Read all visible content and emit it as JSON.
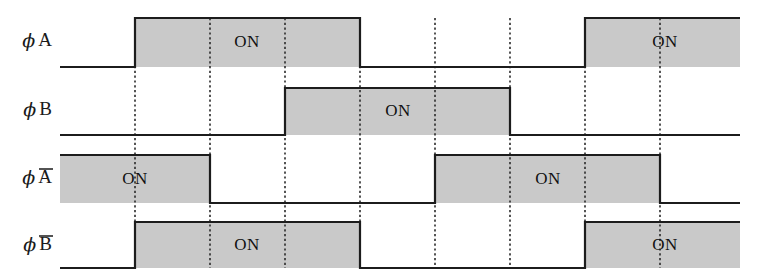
{
  "diagram": {
    "type": "timing-diagram",
    "on_label": "ON",
    "canvas": {
      "width": 759,
      "height": 274
    },
    "geometry": {
      "wave_start_x": 60,
      "wave_end_x": 740,
      "grid_x": [
        135,
        210,
        285,
        360,
        435,
        510,
        585,
        660
      ],
      "grid_top_y": 18,
      "grid_bottom_y": 268
    },
    "colors": {
      "on_fill": "#c9c9c9",
      "line": "#1c1c1c",
      "grid": "#2b2b2b",
      "background": "#ffffff",
      "text": "#111111"
    },
    "rows": [
      {
        "id": "phi-a",
        "label_phi": "ϕ",
        "label_signal": "A",
        "overbar": false,
        "top_y": 18,
        "base_y": 67,
        "label_y": 42,
        "on_intervals": [
          {
            "start": 135,
            "end": 360,
            "label": "ON",
            "label_x": 247
          },
          {
            "start": 585,
            "end": 740,
            "label": "ON",
            "label_x": 665
          }
        ]
      },
      {
        "id": "phi-b",
        "label_phi": "ϕ",
        "label_signal": "B",
        "overbar": false,
        "top_y": 88,
        "base_y": 135,
        "label_y": 111,
        "on_intervals": [
          {
            "start": 285,
            "end": 510,
            "label": "ON",
            "label_x": 398
          }
        ]
      },
      {
        "id": "phi-a-bar",
        "label_phi": "ϕ",
        "label_signal": "A",
        "overbar": true,
        "top_y": 155,
        "base_y": 203,
        "label_y": 179,
        "on_intervals": [
          {
            "start": 60,
            "end": 210,
            "label": "ON",
            "label_x": 135
          },
          {
            "start": 435,
            "end": 660,
            "label": "ON",
            "label_x": 548
          }
        ]
      },
      {
        "id": "phi-b-bar",
        "label_phi": "ϕ",
        "label_signal": "B",
        "overbar": true,
        "top_y": 222,
        "base_y": 268,
        "label_y": 246,
        "on_intervals": [
          {
            "start": 135,
            "end": 360,
            "label": "ON",
            "label_x": 247
          },
          {
            "start": 585,
            "end": 740,
            "label": "ON",
            "label_x": 665
          }
        ]
      }
    ]
  },
  "chart_data": {
    "type": "line",
    "xlabel": "",
    "ylabel": "",
    "x": [
      135,
      210,
      285,
      360,
      435,
      510,
      585,
      660
    ],
    "xlim": [
      60,
      740
    ],
    "grid": true,
    "legend_position": "left",
    "series": [
      {
        "name": "ϕA",
        "on_intervals": [
          [
            135,
            360
          ],
          [
            585,
            740
          ]
        ],
        "values": [
          1,
          1,
          1,
          0,
          0,
          0,
          1,
          1
        ]
      },
      {
        "name": "ϕB",
        "on_intervals": [
          [
            285,
            510
          ]
        ],
        "values": [
          0,
          0,
          1,
          1,
          1,
          0,
          0,
          0
        ]
      },
      {
        "name": "ϕA̅",
        "on_intervals": [
          [
            60,
            210
          ],
          [
            435,
            660
          ]
        ],
        "values": [
          1,
          0,
          0,
          0,
          1,
          1,
          1,
          0
        ]
      },
      {
        "name": "ϕB̅",
        "on_intervals": [
          [
            135,
            360
          ],
          [
            585,
            740
          ]
        ],
        "values": [
          1,
          1,
          1,
          0,
          0,
          0,
          1,
          1
        ]
      }
    ],
    "annotations": [
      "ON",
      "ON",
      "ON",
      "ON",
      "ON",
      "ON"
    ]
  }
}
